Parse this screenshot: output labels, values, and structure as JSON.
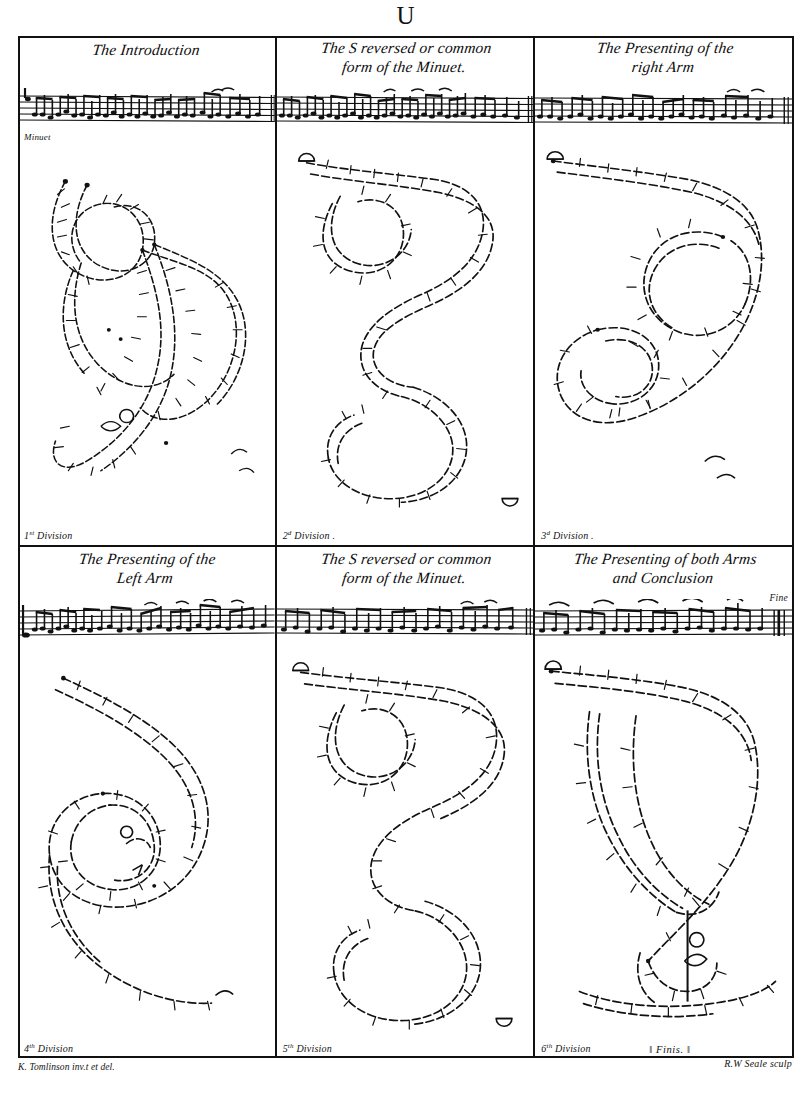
{
  "plate": {
    "letter": "U",
    "engraver_credit": "R.W Seale sculp",
    "author_credit": "K. Tomlinson inv.t et del."
  },
  "panels": [
    {
      "title": "The Introduction",
      "title_lines": [
        "The Introduction"
      ],
      "tempo": "Minuet",
      "division": "1",
      "division_suffix": "st",
      "division_label": "Division",
      "figure": "double-loop-S",
      "fine": ""
    },
    {
      "title": "The S reversed or common form of the Minuet",
      "title_lines": [
        "The S reversed or common",
        "form of the Minuet."
      ],
      "tempo": "",
      "division": "2",
      "division_suffix": "d",
      "division_label": "Division .",
      "figure": "reversed-S",
      "fine": ""
    },
    {
      "title": "The Presenting of the right Arm",
      "title_lines": [
        "The Presenting of the",
        "right Arm"
      ],
      "tempo": "",
      "division": "3",
      "division_suffix": "d",
      "division_label": "Division .",
      "figure": "spiral-right",
      "fine": ""
    },
    {
      "title": "The Presenting of the Left Arm",
      "title_lines": [
        "The Presenting of the",
        "Left Arm"
      ],
      "tempo": "",
      "division": "4",
      "division_suffix": "th",
      "division_label": "Division",
      "figure": "spiral-left",
      "fine": ""
    },
    {
      "title": "The S reversed or common form of the Minuet",
      "title_lines": [
        "The S reversed or common",
        "form of the Minuet."
      ],
      "tempo": "",
      "division": "5",
      "division_suffix": "th",
      "division_label": "Division",
      "figure": "reversed-S",
      "fine": ""
    },
    {
      "title": "The Presenting of both Arms and Conclusion",
      "title_lines": [
        "The Presenting of both Arms",
        "and Conclusion"
      ],
      "tempo": "",
      "division": "6",
      "division_suffix": "th",
      "division_label": "Division",
      "figure": "both-arms-conclusion",
      "fine": "Finis.",
      "staff_end_mark": "Fine"
    }
  ],
  "colors": {
    "ink": "#111111",
    "paper": "#ffffff"
  }
}
